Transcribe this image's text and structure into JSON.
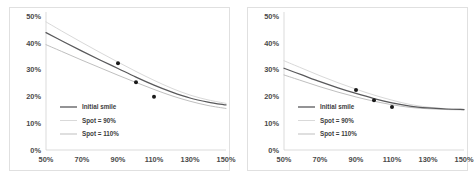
{
  "figure": {
    "background_color": "#ffffff",
    "panel_border_color": "#e0e0e0"
  },
  "charts": [
    {
      "name": "left-chart",
      "legend": {
        "position": "lower-left",
        "entries": [
          {
            "label": "Initial smile",
            "color": "#59595b"
          },
          {
            "label": "Spot = 90%",
            "color": "#d9d9d9"
          },
          {
            "label": "Spot = 110%",
            "color": "#bfbfbf"
          }
        ]
      },
      "axes": {
        "x_ticks": [
          "50%",
          "70%",
          "90%",
          "110%",
          "130%",
          "150%"
        ],
        "y_ticks": [
          "0%",
          "10%",
          "20%",
          "30%",
          "40%",
          "50%"
        ]
      }
    },
    {
      "name": "right-chart",
      "legend": {
        "position": "lower-left",
        "entries": [
          {
            "label": "Initial smile",
            "color": "#59595b"
          },
          {
            "label": "Spot = 90%",
            "color": "#d9d9d9"
          },
          {
            "label": "Spot = 110%",
            "color": "#bfbfbf"
          }
        ]
      },
      "axes": {
        "x_ticks": [
          "50%",
          "70%",
          "90%",
          "110%",
          "130%",
          "150%"
        ],
        "y_ticks": [
          "0%",
          "10%",
          "20%",
          "30%",
          "40%",
          "50%"
        ]
      }
    }
  ],
  "chart_data": [
    {
      "type": "line",
      "title": "",
      "xlabel": "",
      "ylabel": "",
      "xlim": [
        50,
        150
      ],
      "ylim": [
        0,
        50
      ],
      "xtick_values": [
        50,
        70,
        90,
        110,
        130,
        150
      ],
      "xtick_labels": [
        "50%",
        "70%",
        "90%",
        "110%",
        "130%",
        "150%"
      ],
      "ytick_values": [
        0,
        10,
        20,
        30,
        40,
        50
      ],
      "ytick_labels": [
        "0%",
        "10%",
        "20%",
        "30%",
        "40%",
        "50%"
      ],
      "grid": false,
      "legend_position": "lower left",
      "x": [
        50,
        60,
        70,
        80,
        90,
        100,
        110,
        120,
        130,
        140,
        150
      ],
      "series": [
        {
          "name": "Initial smile",
          "color": "#59595b",
          "values": [
            43.8,
            40.3,
            36.9,
            33.6,
            30.4,
            27.2,
            24.2,
            21.6,
            19.4,
            17.9,
            16.8
          ]
        },
        {
          "name": "Spot = 90%",
          "color": "#d9d9d9",
          "values": [
            47.8,
            43.9,
            40.1,
            36.4,
            32.8,
            29.3,
            26.0,
            23.0,
            20.5,
            18.7,
            17.4
          ]
        },
        {
          "name": "Spot = 110%",
          "color": "#bfbfbf",
          "values": [
            39.3,
            36.4,
            33.5,
            30.7,
            27.9,
            25.2,
            22.6,
            20.2,
            18.2,
            16.6,
            15.5
          ]
        }
      ],
      "markers": {
        "name": "Market quotes",
        "color": "#1a1a1a",
        "points": [
          {
            "x": 90,
            "y": 32.4
          },
          {
            "x": 100,
            "y": 25.3
          },
          {
            "x": 110,
            "y": 19.9
          }
        ]
      }
    },
    {
      "type": "line",
      "title": "",
      "xlabel": "",
      "ylabel": "",
      "xlim": [
        50,
        150
      ],
      "ylim": [
        0,
        50
      ],
      "xtick_values": [
        50,
        70,
        90,
        110,
        130,
        150
      ],
      "xtick_labels": [
        "50%",
        "70%",
        "90%",
        "110%",
        "130%",
        "150%"
      ],
      "ytick_values": [
        0,
        10,
        20,
        30,
        40,
        50
      ],
      "ytick_labels": [
        "0%",
        "10%",
        "20%",
        "30%",
        "40%",
        "50%"
      ],
      "grid": false,
      "legend_position": "lower left",
      "x": [
        50,
        60,
        70,
        80,
        90,
        100,
        110,
        120,
        130,
        140,
        150
      ],
      "series": [
        {
          "name": "Initial smile",
          "color": "#59595b",
          "values": [
            30.5,
            28.0,
            25.5,
            23.2,
            21.1,
            19.2,
            17.6,
            16.4,
            15.7,
            15.3,
            15.1
          ]
        },
        {
          "name": "Spot = 90%",
          "color": "#d9d9d9",
          "values": [
            33.3,
            30.5,
            27.7,
            25.1,
            22.7,
            20.5,
            18.6,
            17.0,
            16.0,
            15.4,
            15.2
          ]
        },
        {
          "name": "Spot = 110%",
          "color": "#bfbfbf",
          "values": [
            28.0,
            25.8,
            23.6,
            21.6,
            19.8,
            18.2,
            16.9,
            15.9,
            15.4,
            15.1,
            15.0
          ]
        }
      ],
      "markers": {
        "name": "Market quotes",
        "color": "#1a1a1a",
        "points": [
          {
            "x": 90,
            "y": 22.4
          },
          {
            "x": 100,
            "y": 18.6
          },
          {
            "x": 110,
            "y": 16.0
          }
        ]
      }
    }
  ]
}
